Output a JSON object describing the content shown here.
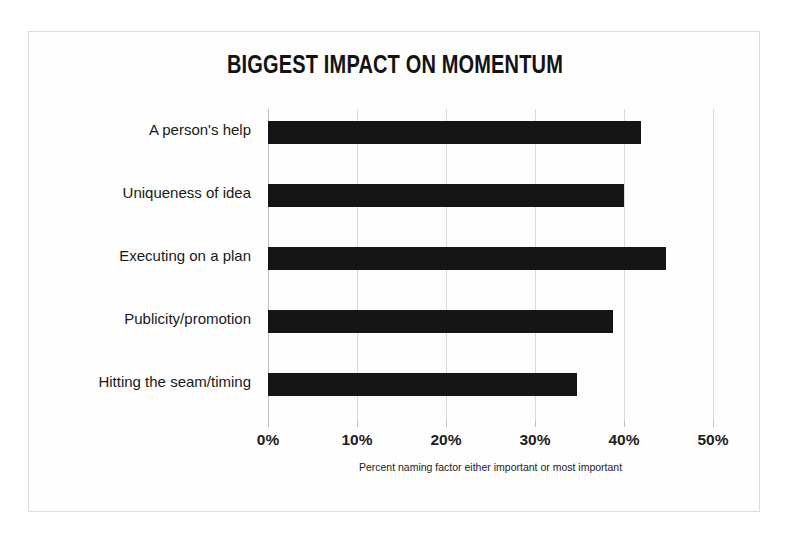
{
  "chart_data": {
    "type": "bar",
    "orientation": "horizontal",
    "title": "BIGGEST IMPACT ON MOMENTUM",
    "xlabel": "Percent naming factor either important or most important",
    "ylabel": "",
    "categories": [
      "A person's help",
      "Uniqueness of idea",
      "Executing on a plan",
      "Publicity/promotion",
      "Hitting the seam/timing"
    ],
    "values": [
      41.9,
      40.0,
      44.7,
      38.8,
      34.7
    ],
    "xlim": [
      0,
      50
    ],
    "xticks": [
      0,
      10,
      20,
      30,
      40,
      50
    ],
    "xtick_labels": [
      "0%",
      "10%",
      "20%",
      "30%",
      "40%",
      "50%"
    ],
    "grid": true,
    "grid_axis": "x",
    "legend": false,
    "bar_color": "#151515",
    "grid_color": "#d9d9d9",
    "background": "#fefefe",
    "border_color": "#dcdcdc",
    "text_color": "#1a1a1a"
  }
}
